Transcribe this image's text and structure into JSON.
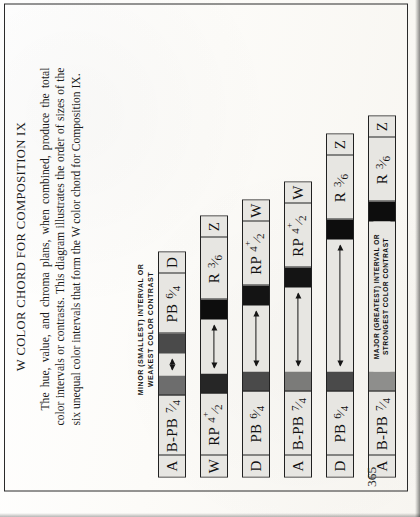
{
  "document": {
    "title": "W COLOR CHORD FOR COMPOSITION IX",
    "paragraph": "The hue, value, and chroma plans, when combined, produce the total color intervals or contrasts. This diagram illustrates the order of sizes of the six unequal color intervals that form the W color chord for Composition IX.",
    "folio": "365"
  },
  "annotations": {
    "minor": "MINOR (SMALLEST) INTERVAL OR\nWEAKEST COLOR CONTRAST",
    "minor_line1": "MINOR (SMALLEST) INTERVAL OR",
    "minor_line2": "WEAKEST COLOR CONTRAST",
    "major_line1": "MAJOR (GREATEST) INTERVAL OR",
    "major_line2": "STRONGEST COLOR CONTRAST"
  },
  "colors": {
    "paper": "#e7e6e2",
    "ink": "#212121",
    "swatch_black": "#0d0d0d",
    "swatch_dark_gray": "#4a4a4a",
    "swatch_mid_gray": "#6d6d6d",
    "swatch_light_gray": "#8e8e8c"
  },
  "chart_data": {
    "type": "bar",
    "title": "W COLOR CHORD FOR COMPOSITION IX",
    "xlabel": "",
    "ylabel": "",
    "orientation": "horizontal",
    "note": "Six color-interval bars drawn to scale; bar length encodes interval size (smallest at top, greatest at bottom).",
    "categories": [
      "1",
      "2",
      "3",
      "4",
      "5",
      "6"
    ],
    "values": [
      86,
      147,
      172,
      196,
      250,
      290
    ],
    "unit": "px (relative interval length)",
    "bars": [
      {
        "index": 1,
        "rank": "minor (smallest) interval",
        "start_letter": "A",
        "start_notation": "B-PB 7/4",
        "end_notation": "PB 6/4",
        "end_letter": "D",
        "start_swatch": "#6d6d6d",
        "end_swatch": "#4a4a4a",
        "gap_width": 22,
        "total_width": 226
      },
      {
        "index": 2,
        "rank": "interval 2",
        "start_letter": "W",
        "start_notation": "RP 4⁺/2",
        "end_notation": "R 3/6",
        "end_letter": "Z",
        "start_swatch": "#262626",
        "end_swatch": "#0d0d0d",
        "gap_width": 54,
        "total_width": 262
      },
      {
        "index": 3,
        "rank": "interval 3",
        "start_letter": "D",
        "start_notation": "PB 6/4",
        "end_notation": "RP 4⁺/2",
        "end_letter": "W",
        "start_swatch": "#4a4a4a",
        "end_swatch": "#141414",
        "gap_width": 66,
        "total_width": 278
      },
      {
        "index": 4,
        "rank": "interval 4",
        "start_letter": "A",
        "start_notation": "B-PB 7/4",
        "end_notation": "RP 4⁺/2",
        "end_letter": "W",
        "start_swatch": "#7b7b79",
        "end_swatch": "#141414",
        "gap_width": 84,
        "total_width": 296
      },
      {
        "index": 5,
        "rank": "interval 5",
        "start_letter": "D",
        "start_notation": "PB 6/4",
        "end_notation": "R 3/6",
        "end_letter": "Z",
        "start_swatch": "#4a4a4a",
        "end_swatch": "#0d0d0d",
        "gap_width": 132,
        "total_width": 344
      },
      {
        "index": 6,
        "rank": "major (greatest) interval",
        "start_letter": "A",
        "start_notation": "B-PB 7/4",
        "end_notation": "R 3/6",
        "end_letter": "Z",
        "start_swatch": "#8e8e8c",
        "end_swatch": "#0d0d0d",
        "gap_width": 150,
        "total_width": 362,
        "inline_label_line1": "MAJOR (GREATEST) INTERVAL OR",
        "inline_label_line2": "STRONGEST COLOR CONTRAST"
      }
    ]
  }
}
